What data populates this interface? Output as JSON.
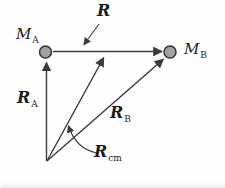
{
  "figure": {
    "colors": {
      "background": "#fefefe",
      "line": "#3b3b3b",
      "mass_fill": "#a2a29e",
      "mass_stroke": "#333333",
      "label": "#1c1c1c"
    },
    "labels": {
      "mass_a": {
        "main": "M",
        "sub": "A"
      },
      "mass_b": {
        "main": "M",
        "sub": "B"
      },
      "vector_r": {
        "main": "R",
        "sub": ""
      },
      "vector_ra": {
        "main": "R",
        "sub": "A"
      },
      "vector_rb": {
        "main": "R",
        "sub": "B"
      },
      "vector_rcm": {
        "main": "R",
        "sub": "cm"
      }
    }
  }
}
